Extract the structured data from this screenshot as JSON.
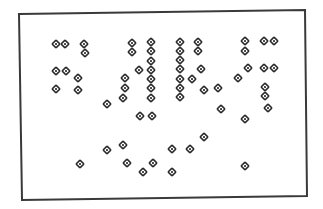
{
  "diagram": {
    "frame": {
      "corners": [
        [
          19,
          14
        ],
        [
          305,
          10
        ],
        [
          307,
          196
        ],
        [
          22,
          200
        ]
      ],
      "stroke": "#3a3a3a",
      "stroke_width": 2
    },
    "marker": {
      "shape": "diamond-with-center-dot",
      "stroke": "#2b2b2b",
      "fill": "#ffffff",
      "center": "#2b2b2b"
    },
    "points": [
      [
        56,
        44
      ],
      [
        65,
        44
      ],
      [
        84,
        44
      ],
      [
        132,
        43
      ],
      [
        151,
        42
      ],
      [
        180,
        42
      ],
      [
        198,
        42
      ],
      [
        245,
        41
      ],
      [
        264,
        41
      ],
      [
        274,
        41
      ],
      [
        85,
        53
      ],
      [
        132,
        52
      ],
      [
        151,
        51
      ],
      [
        180,
        51
      ],
      [
        198,
        51
      ],
      [
        245,
        51
      ],
      [
        151,
        61
      ],
      [
        180,
        60
      ],
      [
        56,
        71
      ],
      [
        66,
        71
      ],
      [
        139,
        70
      ],
      [
        151,
        70
      ],
      [
        180,
        69
      ],
      [
        201,
        69
      ],
      [
        248,
        68
      ],
      [
        264,
        68
      ],
      [
        274,
        68
      ],
      [
        78,
        78
      ],
      [
        125,
        78
      ],
      [
        151,
        79
      ],
      [
        180,
        79
      ],
      [
        192,
        79
      ],
      [
        238,
        78
      ],
      [
        56,
        89
      ],
      [
        78,
        90
      ],
      [
        125,
        88
      ],
      [
        151,
        88
      ],
      [
        180,
        88
      ],
      [
        204,
        90
      ],
      [
        218,
        88
      ],
      [
        265,
        87
      ],
      [
        123,
        98
      ],
      [
        151,
        98
      ],
      [
        180,
        97
      ],
      [
        265,
        96
      ],
      [
        107,
        104
      ],
      [
        221,
        109
      ],
      [
        268,
        108
      ],
      [
        140,
        116
      ],
      [
        152,
        116
      ],
      [
        245,
        119
      ],
      [
        204,
        137
      ],
      [
        123,
        145
      ],
      [
        107,
        150
      ],
      [
        172,
        149
      ],
      [
        190,
        149
      ],
      [
        80,
        164
      ],
      [
        127,
        163
      ],
      [
        153,
        163
      ],
      [
        245,
        166
      ],
      [
        143,
        172
      ],
      [
        172,
        172
      ]
    ]
  }
}
